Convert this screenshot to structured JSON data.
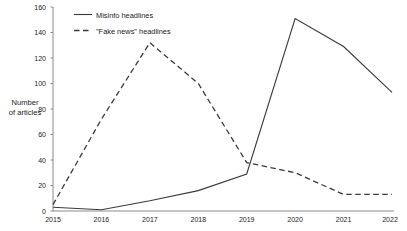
{
  "chart_data": {
    "type": "line",
    "title": "",
    "xlabel": "",
    "ylabel": "Number of articles",
    "ylabel_line1": "Number",
    "ylabel_line2": "of articles",
    "x": [
      2015,
      2016,
      2017,
      2018,
      2019,
      2020,
      2021,
      2022
    ],
    "categories": [
      "2015",
      "2016",
      "2017",
      "2018",
      "2019",
      "2020",
      "2021",
      "2022"
    ],
    "xlim": [
      2015,
      2022
    ],
    "ylim": [
      0,
      160
    ],
    "yticks": [
      0,
      20,
      40,
      60,
      80,
      100,
      120,
      140,
      160
    ],
    "yticklabels": [
      "0",
      "20",
      "40",
      "60",
      "80",
      "100",
      "120",
      "140",
      "160"
    ],
    "grid": false,
    "legend_position": "upper-left",
    "series": [
      {
        "name": "Misinfo headlines",
        "style": "solid",
        "color": "#3a3a3a",
        "values": [
          3,
          1,
          8,
          16,
          29,
          151,
          129,
          93
        ]
      },
      {
        "name": "\"Fake news\" headlines",
        "style": "dashed",
        "color": "#3a3a3a",
        "values": [
          5,
          72,
          132,
          100,
          38,
          30,
          13,
          13
        ]
      }
    ]
  },
  "legend": {
    "items": [
      {
        "label": "Misinfo headlines"
      },
      {
        "label": "\"Fake news\" headlines"
      }
    ]
  },
  "colors": {
    "axis": "#8a8a8a",
    "line": "#3a3a3a",
    "text": "#1a1a1a",
    "background": "#ffffff"
  }
}
